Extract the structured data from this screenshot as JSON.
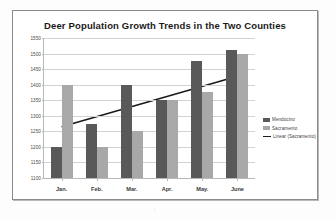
{
  "chart_data": {
    "type": "bar",
    "title": "Deer Population Growth Trends in the Two Counties",
    "xlabel": "",
    "ylabel": "",
    "categories": [
      "Jan.",
      "Feb.",
      "Mar.",
      "Apr.",
      "May.",
      "June"
    ],
    "series": [
      {
        "name": "Mendocino",
        "type": "bar",
        "color": "#595959",
        "values": [
          1200,
          1275,
          1400,
          1350,
          1475,
          1510
        ]
      },
      {
        "name": "Sacramento",
        "type": "bar",
        "color": "#a8a8a8",
        "values": [
          1400,
          1200,
          1250,
          1350,
          1375,
          1500
        ]
      },
      {
        "name": "Linear (Sacramento)",
        "type": "line",
        "color": "#1a1a1a",
        "trendline": true,
        "endpoints": [
          1265,
          1427
        ]
      }
    ],
    "ylim": [
      1100,
      1550
    ],
    "ytick_step": 50,
    "yticks": [
      1100,
      1150,
      1200,
      1250,
      1300,
      1350,
      1400,
      1450,
      1500,
      1550
    ],
    "ytick_labels": [
      "1100",
      "1150",
      "1200",
      "1250",
      "1300",
      "1350",
      "1400",
      "1450",
      "1500",
      "1550"
    ],
    "grid": true,
    "grid_axis": "y",
    "legend_position": "right",
    "legend": [
      "Mendocino",
      "Sacramento",
      "Linear (Sacramento)"
    ]
  }
}
